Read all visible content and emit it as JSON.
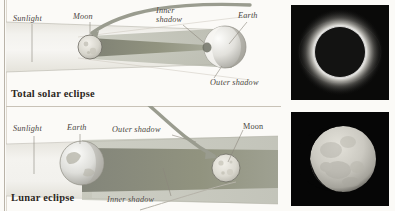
{
  "figure": {
    "type": "astronomy-diagram",
    "background_color": "#fbfaf7"
  },
  "panels": [
    {
      "id": "solar",
      "caption": "Total solar eclipse",
      "labels": {
        "sunlight": "Sunlight",
        "moon": "Moon",
        "inner_shadow": "Inner\nshadow",
        "earth": "Earth",
        "outer_shadow": "Outer shadow"
      },
      "bodies": [
        {
          "name": "moon",
          "label": "Moon",
          "cx": 90,
          "cy": 47,
          "r": 12
        },
        {
          "name": "earth",
          "label": "Earth",
          "cx": 225,
          "cy": 47,
          "r": 21
        }
      ],
      "shadow": {
        "inner_color": "#8f9183",
        "outer_color": "#b9bbae",
        "beam_color": "#eceae4"
      }
    },
    {
      "id": "lunar",
      "caption": "Lunar eclipse",
      "labels": {
        "sunlight": "Sunlight",
        "earth": "Earth",
        "outer_shadow": "Outer shadow",
        "inner_shadow": "Inner shadow",
        "moon": "Moon"
      },
      "bodies": [
        {
          "name": "earth",
          "label": "Earth",
          "cx": 82,
          "cy": 163,
          "r": 22
        },
        {
          "name": "moon",
          "label": "Moon",
          "cx": 226,
          "cy": 168,
          "r": 14
        }
      ],
      "shadow": {
        "inner_color": "#8d8f82",
        "outer_color": "#b6b8ab",
        "beam_color": "#eceae4"
      }
    }
  ],
  "photos": [
    {
      "id": "photo-total-solar-eclipse",
      "alt": "Total solar eclipse with corona",
      "background": "#000000",
      "corona_color": "#f2f0ea"
    },
    {
      "id": "photo-partial-lunar-eclipse",
      "alt": "Partially eclipsed moon",
      "background": "#000000",
      "moon_color": "#cfcdc6"
    }
  ],
  "colors": {
    "ink": "#4a4640",
    "caption_ink": "#2b2722",
    "arrow": "#8b8d80",
    "leader_line": "#8c867c",
    "rule": "#b9b3a8"
  }
}
